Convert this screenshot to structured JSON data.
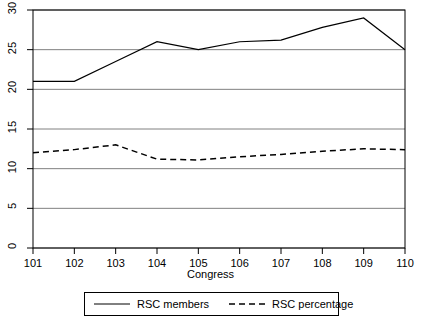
{
  "chart_data": {
    "type": "line",
    "title": "",
    "xlabel": "Congress",
    "ylabel": "",
    "x": [
      101,
      102,
      103,
      104,
      105,
      106,
      107,
      108,
      109,
      110
    ],
    "categories": [
      "101",
      "102",
      "103",
      "104",
      "105",
      "106",
      "107",
      "108",
      "109",
      "110"
    ],
    "series": [
      {
        "name": "RSC members",
        "style": "solid",
        "color": "#000000",
        "values": [
          21,
          21,
          23.5,
          26,
          25,
          26,
          26.2,
          27.8,
          29,
          25
        ]
      },
      {
        "name": "RSC percentage",
        "style": "dashed",
        "color": "#000000",
        "values": [
          12,
          12.4,
          13,
          11.2,
          11.1,
          11.5,
          11.8,
          12.2,
          12.5,
          12.4
        ]
      }
    ],
    "ylim": [
      0,
      30
    ],
    "xlim": [
      101,
      110
    ],
    "yticks": [
      0,
      5,
      10,
      15,
      20,
      25,
      30
    ],
    "ytick_labels": [
      "0",
      "5",
      "10",
      "15",
      "20",
      "25",
      "30"
    ],
    "xticks": [
      101,
      102,
      103,
      104,
      105,
      106,
      107,
      108,
      109,
      110
    ],
    "grid": true,
    "grid_axis": "y",
    "legend_position": "bottom-center",
    "frame": true
  },
  "legend": {
    "items": [
      {
        "label": "RSC members",
        "style": "solid"
      },
      {
        "label": "RSC percentage",
        "style": "dashed"
      }
    ]
  },
  "axes": {
    "x_title": "Congress"
  },
  "colors": {
    "line": "#000000",
    "grid": "#808080",
    "frame": "#000000",
    "background": "#ffffff"
  }
}
